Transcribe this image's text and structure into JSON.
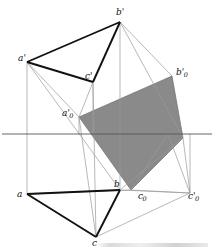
{
  "figure": {
    "type": "descriptive-geometry-projection-diagram",
    "width": 214,
    "height": 251,
    "background_color": "#ffffff",
    "shaded_fill_color": "#8a8a8a",
    "thick_line_color": "#111111",
    "thin_line_color": "#999999",
    "ground_line_color": "#555555"
  },
  "labels": [
    {
      "id": "a-prime",
      "text": "a",
      "sub": "",
      "prime": "'",
      "x": 18,
      "y": 54
    },
    {
      "id": "b-prime",
      "text": "b",
      "sub": "",
      "prime": "'",
      "x": 116,
      "y": 8
    },
    {
      "id": "c-prime",
      "text": "c",
      "sub": "",
      "prime": "'",
      "x": 85,
      "y": 72
    },
    {
      "id": "b-zero-prime",
      "text": "b",
      "sub": "0",
      "prime": "'",
      "x": 176,
      "y": 68
    },
    {
      "id": "a-zero-prime",
      "text": "a",
      "sub": "0",
      "prime": "'",
      "x": 62,
      "y": 109
    },
    {
      "id": "a",
      "text": "a",
      "sub": "",
      "prime": "",
      "x": 17,
      "y": 190
    },
    {
      "id": "b",
      "text": "b",
      "sub": "",
      "prime": "",
      "x": 114,
      "y": 180
    },
    {
      "id": "c",
      "text": "c",
      "sub": "",
      "prime": "",
      "x": 92,
      "y": 239
    },
    {
      "id": "c-zero",
      "text": "c",
      "sub": "0",
      "prime": "",
      "x": 138,
      "y": 192
    },
    {
      "id": "c-zero-prime",
      "text": "c",
      "sub": "0",
      "prime": "'",
      "x": 188,
      "y": 192
    }
  ],
  "points": {
    "a_prime": {
      "x": 27,
      "y": 62
    },
    "b_prime": {
      "x": 120,
      "y": 22
    },
    "c_prime": {
      "x": 93,
      "y": 82
    },
    "a": {
      "x": 27,
      "y": 194
    },
    "b": {
      "x": 120,
      "y": 190
    },
    "c": {
      "x": 96,
      "y": 237
    },
    "a_zero_prime": {
      "x": 79,
      "y": 117
    },
    "b_zero_prime": {
      "x": 172,
      "y": 76
    },
    "c_zero": {
      "x": 131,
      "y": 190
    },
    "c_zero_prime": {
      "x": 190,
      "y": 193
    },
    "right_node": {
      "x": 183,
      "y": 138
    },
    "gl_left": {
      "x": 2,
      "y": 134
    },
    "gl_right": {
      "x": 212,
      "y": 134
    }
  },
  "shaded_polygon": {
    "name": "rotated-true-shape-quadrilateral",
    "vertices": [
      "a_zero_prime",
      "b_zero_prime",
      "right_node",
      "c_zero"
    ]
  },
  "caption": {
    "text": ""
  }
}
